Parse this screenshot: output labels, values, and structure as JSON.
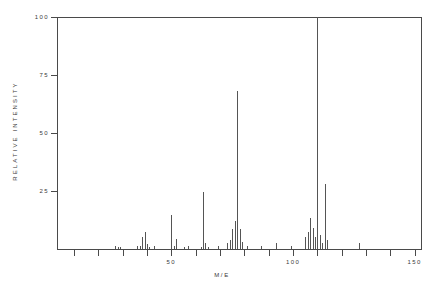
{
  "chart_data": {
    "type": "bar",
    "title": "",
    "subtitle": "",
    "xlabel": "M/E",
    "ylabel": "RELATIVE INTENSITY",
    "xlim": [
      3,
      153
    ],
    "ylim": [
      0,
      100
    ],
    "grid": false,
    "legend": null,
    "x_ticks": [
      10,
      20,
      30,
      40,
      50,
      60,
      70,
      80,
      90,
      100,
      110,
      120,
      130,
      140,
      150
    ],
    "x_tick_labels": [
      "",
      "",
      "",
      "",
      "50",
      "",
      "",
      "",
      "",
      "100",
      "",
      "",
      "",
      "",
      "150"
    ],
    "y_ticks": [
      25,
      50,
      75,
      100
    ],
    "y_tick_labels": [
      "25",
      "50",
      "75",
      "100"
    ],
    "series": [
      {
        "name": "mass spectrum",
        "x": [
          27,
          28,
          29,
          36,
          37,
          38,
          39,
          40,
          41,
          43,
          50,
          51,
          52,
          55,
          57,
          62,
          63,
          64,
          65,
          69,
          73,
          74,
          75,
          76,
          77,
          78,
          79,
          81,
          87,
          93,
          99,
          105,
          106,
          107,
          108,
          109,
          110,
          111,
          112,
          113,
          114,
          127
        ],
        "values": [
          1.5,
          1.0,
          1.0,
          1.2,
          1.5,
          5.0,
          7.5,
          2.0,
          1.0,
          1.5,
          14.5,
          1.5,
          4.5,
          1.0,
          1.5,
          1.0,
          24.5,
          2.5,
          1.0,
          1.5,
          2.5,
          4.0,
          8.5,
          12.0,
          68.0,
          8.5,
          3.0,
          1.5,
          1.5,
          2.5,
          1.5,
          5.0,
          7.5,
          13.5,
          9.0,
          5.0,
          100.0,
          6.0,
          2.5,
          28.0,
          4.0,
          2.5
        ]
      }
    ]
  },
  "axes": {
    "y_title": "RELATIVE INTENSITY",
    "x_title": "M/E"
  },
  "colors": {
    "peak": "#555555",
    "axis": "#4a4a4a",
    "text": "#3a3a3a",
    "background": "#ffffff"
  }
}
